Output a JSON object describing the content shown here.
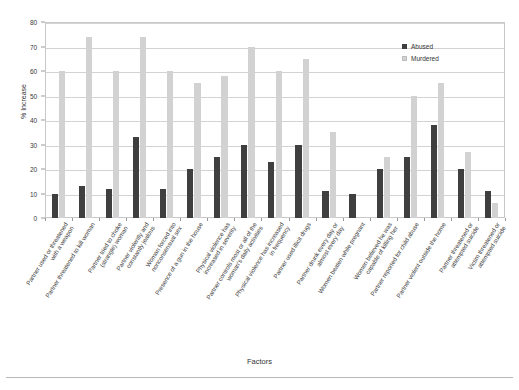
{
  "chart_data": {
    "type": "bar",
    "title": "",
    "xlabel": "Factors",
    "ylabel": "% Increase",
    "ylim": [
      0,
      80
    ],
    "ytick_values": [
      0,
      10,
      20,
      30,
      40,
      50,
      60,
      70,
      80
    ],
    "grid": true,
    "legend_position": "top-right",
    "categories": [
      "Partner used or threatened\nwith a weapon",
      "Partner threatened to kill woman",
      "Partner tried to choke\n(strangle) woman",
      "Partner violently and\nconstantly jealous",
      "Woman forced into\nnonconsensual sex",
      "Presence of a gun in the house",
      "Physical violence has\nincreased in severity",
      "Partner controls most or all of the\nwoman's daily activities",
      "Physical violence has increased\nin frequency",
      "Partner used illicit drugs",
      "Partner drunk every day or\nalmost every day",
      "Women beaten while pregnant",
      "Women believed he was\ncapable of killing her",
      "Partner reported for child abuse",
      "Partner violent outside the home",
      "Partner threatened or\nattempted suicide",
      "Victim threatened or\nattempted suicide"
    ],
    "series": [
      {
        "name": "Abused",
        "color": "#3f3f3f",
        "values": [
          10,
          13,
          12,
          33,
          12,
          20,
          25,
          30,
          23,
          30,
          11,
          10,
          20,
          25,
          38,
          20,
          11
        ]
      },
      {
        "name": "Murdered",
        "color": "#d2d2d2",
        "values": [
          60,
          74,
          60,
          74,
          60,
          55,
          58,
          70,
          60,
          65,
          35,
          0,
          25,
          50,
          55,
          27,
          6
        ]
      }
    ]
  },
  "legend": {
    "items": [
      {
        "label": "Abused"
      },
      {
        "label": "Murdered"
      }
    ]
  }
}
